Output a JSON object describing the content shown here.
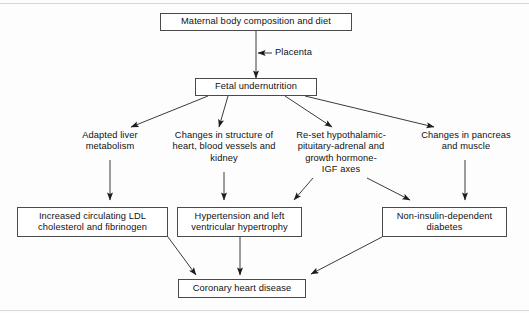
{
  "figure": {
    "border_color": "#4a4a4a",
    "text_color": "#111111",
    "background_color": "#ffffff"
  },
  "nodes": {
    "maternal": "Maternal body composition and diet",
    "fetal": "Fetal undernutrition",
    "ldl": "Increased circulating LDL\ncholesterol and fibrinogen",
    "hypertension": "Hypertension and left\nventricular hypertrophy",
    "diabetes": "Non-insulin-dependent\ndiabetes",
    "coronary": "Coronary heart disease"
  },
  "labels": {
    "placenta": "Placenta",
    "liver": "Adapted liver\nmetabolism",
    "structure": "Changes in structure of\nheart, blood vessels and\nkidney",
    "axes": "Re-set hypothalamic-\npituitary-adrenal and\ngrowth hormone-\nIGF axes",
    "pancreas": "Changes in pancreas\nand muscle"
  },
  "diagram_flow": {
    "type": "flowchart",
    "direction": "top-down",
    "edges": [
      {
        "from": "maternal",
        "to": "fetal",
        "label": "Placenta",
        "style": "solid-line-with-side-arrow"
      },
      {
        "from": "fetal",
        "to": "liver",
        "style": "arrow"
      },
      {
        "from": "fetal",
        "to": "structure",
        "style": "arrow"
      },
      {
        "from": "fetal",
        "to": "axes",
        "style": "arrow"
      },
      {
        "from": "fetal",
        "to": "pancreas",
        "style": "arrow"
      },
      {
        "from": "liver",
        "to": "ldl",
        "style": "arrow"
      },
      {
        "from": "structure",
        "to": "hypertension",
        "style": "arrow"
      },
      {
        "from": "axes",
        "to": "hypertension",
        "style": "arrow"
      },
      {
        "from": "axes",
        "to": "diabetes",
        "style": "arrow"
      },
      {
        "from": "pancreas",
        "to": "diabetes",
        "style": "arrow"
      },
      {
        "from": "ldl",
        "to": "coronary",
        "style": "arrow"
      },
      {
        "from": "hypertension",
        "to": "coronary",
        "style": "arrow"
      },
      {
        "from": "diabetes",
        "to": "coronary",
        "style": "arrow"
      }
    ]
  }
}
